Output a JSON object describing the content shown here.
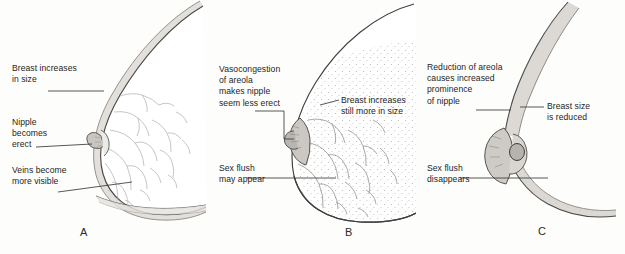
{
  "figure": {
    "background_color": "#fdfdfc",
    "ink_color": "#1d1d1d",
    "line_color": "#3a3a3a",
    "shade_color": "#d8d6d2"
  },
  "panels": [
    {
      "id": "A",
      "letter": "A",
      "phase": "excitement",
      "labels": [
        {
          "name": "breast-increases",
          "lines": [
            "Breast increases",
            "in size"
          ]
        },
        {
          "name": "nipple-erect",
          "lines": [
            "Nipple",
            "becomes",
            "erect"
          ]
        },
        {
          "name": "veins-visible",
          "lines": [
            "Veins become",
            "more visible"
          ]
        }
      ]
    },
    {
      "id": "B",
      "letter": "B",
      "phase": "plateau",
      "labels": [
        {
          "name": "vasocongestion-areola",
          "lines": [
            "Vasocongestion",
            "of areola",
            "makes nipple",
            "seem less erect"
          ]
        },
        {
          "name": "breast-increases-more",
          "lines": [
            "Breast increases",
            "still more in size"
          ]
        },
        {
          "name": "sex-flush-appears",
          "lines": [
            "Sex flush",
            "may appear"
          ]
        }
      ]
    },
    {
      "id": "C",
      "letter": "C",
      "phase": "resolution",
      "labels": [
        {
          "name": "areola-reduction",
          "lines": [
            "Reduction of areola",
            "causes increased",
            "prominence",
            "of nipple"
          ]
        },
        {
          "name": "breast-size-reduced",
          "lines": [
            "Breast size",
            "is reduced"
          ]
        },
        {
          "name": "sex-flush-disappears",
          "lines": [
            "Sex flush",
            "disappears"
          ]
        }
      ]
    }
  ]
}
